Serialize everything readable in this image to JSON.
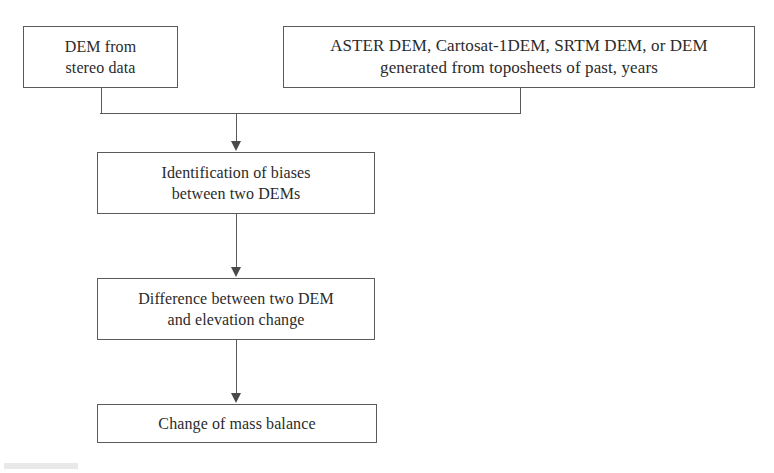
{
  "diagram": {
    "type": "flowchart",
    "orientation": "top-to-bottom",
    "colors": {
      "background": "#ffffff",
      "box_border": "#5a5a5a",
      "connector": "#5a5a5a",
      "arrowhead": "#4a4a4a",
      "text": "#2b2b2b"
    },
    "nodes": [
      {
        "id": "stereo_dem",
        "label": "DEM from\nstereo data",
        "lines": [
          "DEM from",
          "stereo data"
        ],
        "shape": "rectangle",
        "level": 1
      },
      {
        "id": "archive_dem",
        "label": "ASTER DEM, Cartosat-1DEM, SRTM DEM, or DEM\ngenerated from toposheets of past, years",
        "lines": [
          "ASTER DEM, Cartosat-1DEM, SRTM DEM, or DEM",
          "generated from toposheets of past, years"
        ],
        "shape": "rectangle",
        "level": 1
      },
      {
        "id": "bias_identification",
        "label": "Identification of biases\nbetween two DEMs",
        "lines": [
          "Identification of biases",
          "between two DEMs"
        ],
        "shape": "rectangle",
        "level": 2
      },
      {
        "id": "dem_difference",
        "label": "Difference between two DEM\nand elevation change",
        "lines": [
          "Difference between two DEM",
          "and elevation change"
        ],
        "shape": "rectangle",
        "level": 3
      },
      {
        "id": "mass_balance",
        "label": "Change of mass balance",
        "lines": [
          "Change of mass balance"
        ],
        "shape": "rectangle",
        "level": 4
      }
    ],
    "edges": [
      {
        "id": "e1",
        "from": "stereo_dem",
        "to": "bias_identification",
        "style": "elbow-merge",
        "arrow": true
      },
      {
        "id": "e2",
        "from": "archive_dem",
        "to": "bias_identification",
        "style": "elbow-merge",
        "arrow": true
      },
      {
        "id": "e3",
        "from": "bias_identification",
        "to": "dem_difference",
        "style": "straight",
        "arrow": true
      },
      {
        "id": "e4",
        "from": "dem_difference",
        "to": "mass_balance",
        "style": "straight",
        "arrow": true
      }
    ]
  }
}
